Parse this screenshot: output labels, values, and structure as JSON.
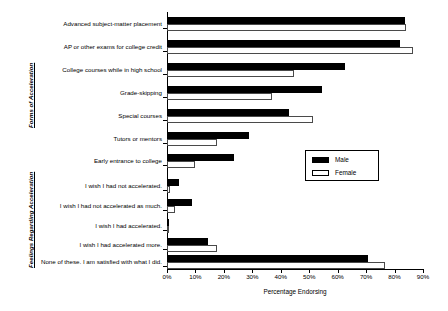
{
  "chart_data": {
    "type": "bar",
    "orientation": "horizontal",
    "title": "",
    "xlabel": "Percentage Endorsing",
    "ylabel": "",
    "xlim": [
      0,
      90
    ],
    "xticks": [
      "0%",
      "10%",
      "20%",
      "30%",
      "40%",
      "50%",
      "60%",
      "70%",
      "80%",
      "90%"
    ],
    "grid": false,
    "legend_position": "middle-right",
    "group_labels": {
      "forms": "Forms of Acceleration",
      "feelings": "Feelings Regarding Acceleration"
    },
    "categories": [
      "Advanced subject-matter placement",
      "AP or other exams for college credit",
      "College courses while in high school",
      "Grade-skipping",
      "Special courses",
      "Tutors or mentors",
      "Early entrance to college",
      "I wish I had not accelerated.",
      "I wish I had not accelerated as much.",
      "I wish I had accelerated.",
      "I wish I had accelerated more.",
      "None of these.  I am satisfied with what I did."
    ],
    "series": [
      {
        "name": "Male",
        "color": "#000000",
        "values": [
          83.5,
          82.0,
          62.5,
          54.5,
          43.0,
          29.0,
          23.5,
          4.2,
          8.8,
          0.7,
          14.4,
          70.8
        ]
      },
      {
        "name": "Female",
        "color": "#ffffff",
        "values": [
          84.0,
          86.5,
          44.5,
          37.0,
          51.5,
          17.5,
          10.0,
          1.1,
          2.8,
          0.3,
          17.5,
          76.8
        ]
      }
    ]
  },
  "legend": {
    "items": [
      {
        "label": "Male",
        "swatch": "filled-black-swatch"
      },
      {
        "label": "Female",
        "swatch": "outlined-white-swatch"
      }
    ]
  }
}
